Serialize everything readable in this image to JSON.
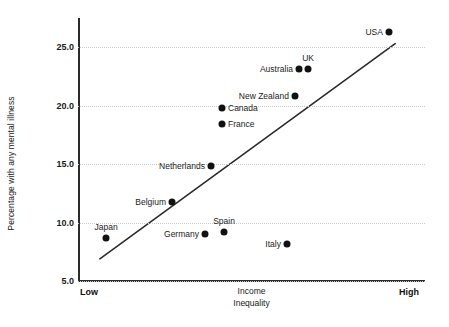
{
  "chart_data": {
    "type": "scatter",
    "title": "",
    "xlabel": "Income Inequality",
    "ylabel": "Percentage with any mental illness",
    "xlabel_line1": "Income",
    "xlabel_line2": "Inequality",
    "x_axis_low_label": "Low",
    "x_axis_high_label": "High",
    "x_axis_type": "ordinal-qualitative",
    "ylim": [
      5.0,
      27.5
    ],
    "y_ticks": [
      "25.0",
      "20.0",
      "15.0",
      "10.0",
      "5.0"
    ],
    "y_tick_values": [
      25.0,
      20.0,
      15.0,
      10.0,
      5.0
    ],
    "grid": "horizontal-dotted",
    "legend": "none",
    "point_color": "#111111",
    "trendline": {
      "present": true,
      "color": "#2b2b2b",
      "x_start_pct": 6.3,
      "y_start_value": 6.9,
      "x_end_pct": 91.4,
      "y_end_value": 25.3
    },
    "points": [
      {
        "label": "Japan",
        "x_pct": 8.1,
        "y_value": 8.7,
        "label_pos": "above"
      },
      {
        "label": "Belgium",
        "x_pct": 27.1,
        "y_value": 11.8,
        "label_pos": "left"
      },
      {
        "label": "Germany",
        "x_pct": 36.6,
        "y_value": 9.0,
        "label_pos": "left"
      },
      {
        "label": "Spain",
        "x_pct": 42.1,
        "y_value": 9.2,
        "label_pos": "above"
      },
      {
        "label": "Netherlands",
        "x_pct": 38.3,
        "y_value": 14.8,
        "label_pos": "left"
      },
      {
        "label": "Italy",
        "x_pct": 60.2,
        "y_value": 8.2,
        "label_pos": "left"
      },
      {
        "label": "France",
        "x_pct": 41.5,
        "y_value": 18.4,
        "label_pos": "right"
      },
      {
        "label": "Canada",
        "x_pct": 41.5,
        "y_value": 19.8,
        "label_pos": "right"
      },
      {
        "label": "New Zealand",
        "x_pct": 62.5,
        "y_value": 20.8,
        "label_pos": "left"
      },
      {
        "label": "Australia",
        "x_pct": 63.7,
        "y_value": 23.1,
        "label_pos": "left"
      },
      {
        "label": "UK",
        "x_pct": 66.3,
        "y_value": 23.1,
        "label_pos": "above"
      },
      {
        "label": "USA",
        "x_pct": 89.6,
        "y_value": 26.3,
        "label_pos": "left"
      }
    ]
  }
}
